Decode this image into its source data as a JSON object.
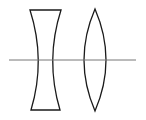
{
  "diagram": {
    "title": "",
    "colors": {
      "background": "#ffffff",
      "lens_stroke": "#1a1a1a",
      "axis_stroke": "#777777"
    },
    "axis": {
      "x1": 9,
      "x2": 136,
      "y": 60
    },
    "elements": [
      {
        "name": "concave-lens",
        "type": "diverging-lens",
        "top": [
          30,
          61,
          10
        ],
        "bottom": [
          31,
          60,
          110
        ],
        "waist": [
          41,
          50
        ]
      },
      {
        "name": "convex-lens",
        "type": "converging-lens",
        "top_tip": [
          95,
          9
        ],
        "bottom_tip": [
          95,
          111
        ],
        "left_x": 84,
        "right_x": 107
      }
    ]
  }
}
